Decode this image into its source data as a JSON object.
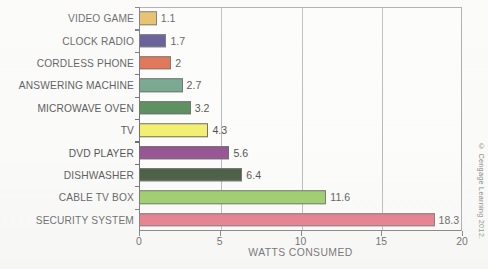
{
  "chart_data": {
    "type": "bar",
    "orientation": "horizontal",
    "title": "",
    "xlabel": "WATTS CONSUMED",
    "ylabel": "",
    "xlim": [
      0,
      20
    ],
    "xticks": [
      0,
      5,
      10,
      15,
      20
    ],
    "xtick_labels": [
      "0",
      "5",
      "10",
      "15",
      "20"
    ],
    "grid": true,
    "gridlines_at": [
      5,
      10,
      15
    ],
    "legend": false,
    "categories": [
      "VIDEO GAME",
      "CLOCK RADIO",
      "CORDLESS PHONE",
      "ANSWERING MACHINE",
      "MICROWAVE OVEN",
      "TV",
      "DVD PLAYER",
      "DISHWASHER",
      "CABLE TV BOX",
      "SECURITY SYSTEM"
    ],
    "values": [
      1.1,
      1.7,
      2,
      2.7,
      3.2,
      4.3,
      5.6,
      6.4,
      11.6,
      18.3
    ],
    "value_labels": [
      "1.1",
      "1.7",
      "2",
      "2.7",
      "3.2",
      "4.3",
      "5.6",
      "6.4",
      "11.6",
      "18.3"
    ],
    "colors": [
      "#e0a82e",
      "#2b2170",
      "#d9441b",
      "#4e8d6e",
      "#2e7031",
      "#f2ed4e",
      "#7e2d7b",
      "#16300f",
      "#7ec03a",
      "#e04a5f"
    ]
  },
  "footer": {
    "copyright": "© Cengage Learning 2012."
  }
}
